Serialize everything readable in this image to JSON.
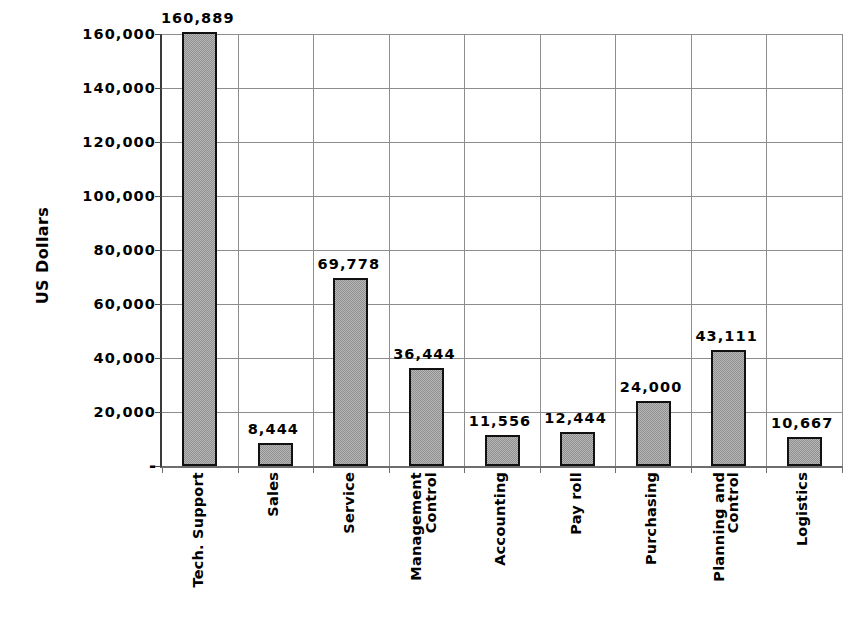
{
  "chart_data": {
    "type": "bar",
    "title": "",
    "subtitle": "",
    "xlabel": "",
    "ylabel": "US Dollars",
    "ylim": [
      0,
      160000
    ],
    "ytick_interval": 20000,
    "grid": true,
    "legend": "none",
    "orientation": "vertical",
    "value_labels_shown": true,
    "categories": [
      "Tech. Support",
      "Sales",
      "Service",
      "Management Control",
      "Accounting",
      "Pay roll",
      "Purchasing",
      "Planning and Control",
      "Logistics"
    ],
    "category_label_lines": [
      [
        "Tech. Support"
      ],
      [
        "Sales"
      ],
      [
        "Service"
      ],
      [
        "Management",
        "Control"
      ],
      [
        "Accounting"
      ],
      [
        "Pay roll"
      ],
      [
        "Purchasing"
      ],
      [
        "Planning and",
        "Control"
      ],
      [
        "Logistics"
      ]
    ],
    "values": [
      160889,
      8444,
      69778,
      36444,
      11556,
      12444,
      24000,
      43111,
      10667
    ],
    "value_labels": [
      "160,889",
      "8,444",
      "69,778",
      "36,444",
      "11,556",
      "12,444",
      "24,000",
      "43,111",
      "10,667"
    ],
    "ytick_values": [
      0,
      20000,
      40000,
      60000,
      80000,
      100000,
      120000,
      140000,
      160000
    ],
    "ytick_labels": [
      "-",
      "20,000",
      "40,000",
      "60,000",
      "80,000",
      "100,000",
      "120,000",
      "140,000",
      "160,000"
    ]
  },
  "colors": {
    "bar_fill": "#b8b8b8",
    "bar_pattern": "#8f8f8f",
    "bar_border": "#111111",
    "gridline": "#8d8d8d",
    "axis": "#3a3a3a",
    "text": "#000000",
    "background": "#ffffff"
  }
}
